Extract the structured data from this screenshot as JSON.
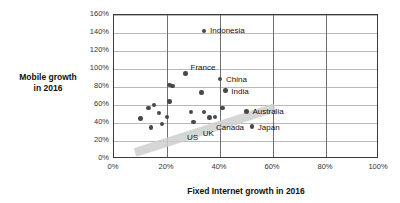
{
  "chart_data": {
    "type": "scatter",
    "title": "",
    "xlabel": "Fixed Internet growth in 2016",
    "ylabel_line1": "Mobile growth",
    "ylabel_line2": "in 2016",
    "xlim": [
      0,
      100
    ],
    "ylim": [
      0,
      160
    ],
    "xticks": [
      "0%",
      "20%",
      "40%",
      "60%",
      "80%",
      "100%"
    ],
    "xtick_values": [
      0,
      20,
      40,
      60,
      80,
      100
    ],
    "yticks": [
      "0%",
      "20%",
      "40%",
      "60%",
      "80%",
      "100%",
      "120%",
      "140%",
      "160%"
    ],
    "ytick_values": [
      0,
      20,
      40,
      60,
      80,
      100,
      120,
      140,
      160
    ],
    "grid": "horizontal-and-vertical",
    "legend": "none",
    "units": "percent",
    "points": [
      {
        "label": "",
        "x": 10,
        "y": 45
      },
      {
        "label": "",
        "x": 13,
        "y": 57
      },
      {
        "label": "",
        "x": 14,
        "y": 35
      },
      {
        "label": "",
        "x": 15,
        "y": 60
      },
      {
        "label": "",
        "x": 17,
        "y": 51
      },
      {
        "label": "",
        "x": 18,
        "y": 39
      },
      {
        "label": "",
        "x": 20,
        "y": 47
      },
      {
        "label": "",
        "x": 21,
        "y": 64
      },
      {
        "label": "",
        "x": 21,
        "y": 82
      },
      {
        "label": "",
        "x": 22,
        "y": 81
      },
      {
        "label": "France",
        "x": 27,
        "y": 95
      },
      {
        "label": "",
        "x": 29,
        "y": 52
      },
      {
        "label": "",
        "x": 30,
        "y": 41
      },
      {
        "label": "",
        "x": 33,
        "y": 74
      },
      {
        "label": "Indonesia",
        "x": 34,
        "y": 142
      },
      {
        "label": "",
        "x": 34,
        "y": 52
      },
      {
        "label": "",
        "x": 36,
        "y": 46
      },
      {
        "label": "",
        "x": 38,
        "y": 47
      },
      {
        "label": "China",
        "x": 40,
        "y": 89
      },
      {
        "label": "",
        "x": 41,
        "y": 57
      },
      {
        "label": "India",
        "x": 42,
        "y": 76
      },
      {
        "label": "Australia",
        "x": 50,
        "y": 53
      },
      {
        "label": "Japan",
        "x": 52,
        "y": 36
      }
    ],
    "annotations": [
      {
        "name": "US",
        "text": "US"
      },
      {
        "name": "UK",
        "text": "UK"
      },
      {
        "name": "Canada",
        "text": "Canada"
      },
      {
        "name": "trend-band",
        "text": ""
      }
    ]
  }
}
